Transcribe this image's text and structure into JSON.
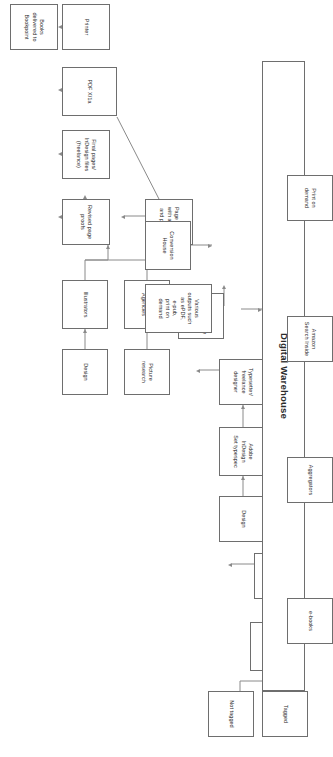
{
  "diagram": {
    "orientation_note": "rotated",
    "colors": {
      "background": "#ffffff",
      "box_border": "#6e6e6e",
      "connector": "#8a8a8a",
      "text": "#2b2b2b"
    },
    "nodes": [
      {
        "id": "tagged",
        "label": "Tagged"
      },
      {
        "id": "not_tagged",
        "label": "Not tagged"
      },
      {
        "id": "word_files",
        "label": "Word files"
      },
      {
        "id": "copy_edited",
        "label": "Copy edited\nmanuscript"
      },
      {
        "id": "design_1",
        "label": "Design"
      },
      {
        "id": "adobe_indesign",
        "label": "Adobe\nInDesign\nSet typespec"
      },
      {
        "id": "typesetter",
        "label": "Typesetter/\nfreelance\ndesigner"
      },
      {
        "id": "indesign_makeup",
        "label": "InDesign Page\nmake-up"
      },
      {
        "id": "picture_research",
        "label": "Picture\nresearch"
      },
      {
        "id": "photo_agencies",
        "label": "Photo\nAgencies"
      },
      {
        "id": "design_2",
        "label": "Design"
      },
      {
        "id": "illustrators",
        "label": "Illustrators"
      },
      {
        "id": "page_proofs",
        "label": "Page proofs\nwith artwork\nand photos"
      },
      {
        "id": "revised_proofs",
        "label": "Revised page\nproofs"
      },
      {
        "id": "final_pages",
        "label": "Final pages/\nInDesign files\n(freelance)"
      },
      {
        "id": "pdf_x1a",
        "label": "PDF X/1a"
      },
      {
        "id": "printer",
        "label": "Printer"
      },
      {
        "id": "books_delivered",
        "label": "Books\ndelivered to\nBookpoint"
      },
      {
        "id": "conversion_house",
        "label": "Conversion\nHouse"
      },
      {
        "id": "various_outputs",
        "label": "Various\noutputs such\nas ePDF,\ne-pub,\nprint on\ndemand"
      },
      {
        "id": "digital_warehouse",
        "label": "Digital Warehouse"
      },
      {
        "id": "ebooks",
        "label": "e-books"
      },
      {
        "id": "aggregators",
        "label": "Aggregators"
      },
      {
        "id": "amazon_search",
        "label": "Amazon\nSearch Inside"
      },
      {
        "id": "print_on_demand",
        "label": "Print on\ndemand"
      }
    ],
    "edges": [
      {
        "from": "tagged",
        "to": "word_files"
      },
      {
        "from": "not_tagged",
        "to": "word_files"
      },
      {
        "from": "word_files",
        "to": "copy_edited"
      },
      {
        "from": "copy_edited",
        "to": "typesetter"
      },
      {
        "from": "design_1",
        "to": "adobe_indesign"
      },
      {
        "from": "adobe_indesign",
        "to": "typesetter"
      },
      {
        "from": "typesetter",
        "to": "indesign_makeup"
      },
      {
        "from": "indesign_makeup",
        "to": "page_proofs"
      },
      {
        "from": "picture_research",
        "to": "photo_agencies"
      },
      {
        "from": "photo_agencies",
        "to": "page_proofs"
      },
      {
        "from": "design_2",
        "to": "illustrators"
      },
      {
        "from": "illustrators",
        "to": "revised_proofs"
      },
      {
        "from": "page_proofs",
        "to": "revised_proofs"
      },
      {
        "from": "revised_proofs",
        "to": "final_pages"
      },
      {
        "from": "final_pages",
        "to": "pdf_x1a"
      },
      {
        "from": "pdf_x1a",
        "to": "printer"
      },
      {
        "from": "pdf_x1a",
        "to": "conversion_house"
      },
      {
        "from": "printer",
        "to": "books_delivered"
      },
      {
        "from": "conversion_house",
        "to": "various_outputs"
      },
      {
        "from": "various_outputs",
        "to": "digital_warehouse"
      },
      {
        "from": "digital_warehouse",
        "to": "ebooks"
      },
      {
        "from": "digital_warehouse",
        "to": "aggregators"
      },
      {
        "from": "digital_warehouse",
        "to": "amazon_search"
      },
      {
        "from": "digital_warehouse",
        "to": "print_on_demand"
      }
    ]
  }
}
